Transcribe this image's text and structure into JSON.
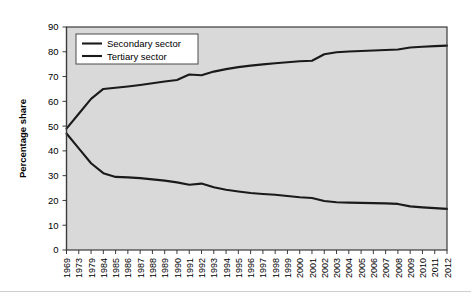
{
  "chart_data": {
    "type": "line",
    "title": "",
    "xlabel": "",
    "ylabel": "Percentage share",
    "ylim": [
      0,
      90
    ],
    "ytick_values": [
      0,
      10,
      20,
      30,
      40,
      50,
      60,
      70,
      80,
      90
    ],
    "grid": false,
    "legend_position": "top-left",
    "categories": [
      "1969",
      "1973",
      "1979",
      "1984",
      "1985",
      "1986",
      "1987",
      "1988",
      "1989",
      "1990",
      "1991",
      "1992",
      "1993",
      "1994",
      "1995",
      "1996",
      "1997",
      "1998",
      "1999",
      "2000",
      "2001",
      "2002",
      "2003",
      "2004",
      "2005",
      "2006",
      "2007",
      "2008",
      "2009",
      "2010",
      "2011",
      "2012"
    ],
    "series": [
      {
        "name": "Secondary sector",
        "values": [
          47.0,
          41.0,
          35.0,
          31.0,
          29.5,
          29.3,
          29.0,
          28.5,
          28.0,
          27.3,
          26.3,
          26.8,
          25.3,
          24.3,
          23.6,
          23.0,
          22.6,
          22.3,
          21.8,
          21.3,
          21.0,
          19.8,
          19.3,
          19.1,
          19.0,
          18.9,
          18.8,
          18.6,
          17.6,
          17.2,
          16.9,
          16.6
        ]
      },
      {
        "name": "Tertiary sector",
        "values": [
          49.0,
          55.0,
          61.0,
          65.0,
          65.5,
          66.0,
          66.6,
          67.3,
          68.0,
          68.6,
          70.8,
          70.5,
          72.0,
          73.0,
          73.8,
          74.4,
          74.9,
          75.4,
          75.8,
          76.2,
          76.4,
          79.0,
          79.8,
          80.1,
          80.3,
          80.5,
          80.7,
          80.9,
          81.7,
          82.0,
          82.3,
          82.5
        ]
      }
    ],
    "legend": [
      {
        "label": "Secondary sector"
      },
      {
        "label": "Tertiary sector"
      }
    ]
  }
}
